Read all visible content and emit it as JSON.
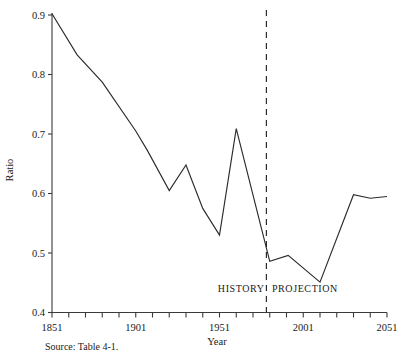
{
  "chart_data": {
    "type": "line",
    "title": "",
    "xlabel": "Year",
    "ylabel": "Ratio",
    "xlim": [
      1851,
      2051
    ],
    "ylim": [
      0.4,
      0.9
    ],
    "xticks": [
      1851,
      1861,
      1871,
      1881,
      1891,
      1901,
      1911,
      1921,
      1931,
      1941,
      1951,
      1961,
      1971,
      1981,
      1991,
      2001,
      2011,
      2021,
      2031,
      2041,
      2051
    ],
    "xtick_labels_shown": [
      "1851",
      "1901",
      "1951",
      "2001",
      "2051"
    ],
    "yticks": [
      0.4,
      0.5,
      0.6,
      0.7,
      0.8,
      0.9
    ],
    "ytick_labels": [
      "0.4",
      "0.5",
      "0.6",
      "0.7",
      "0.8",
      "0.9"
    ],
    "grid": false,
    "legend": "none",
    "x": [
      1851,
      1866,
      1881,
      1901,
      1908,
      1921,
      1931,
      1941,
      1951,
      1961,
      1981,
      1991,
      2001,
      2011,
      2021,
      2031,
      2041,
      2051
    ],
    "values": [
      0.902,
      0.833,
      0.787,
      0.705,
      0.672,
      0.605,
      0.648,
      0.575,
      0.53,
      0.709,
      0.486,
      0.486,
      0.496,
      0.451,
      0.516,
      0.598,
      0.592,
      0.595
    ],
    "series": [
      {
        "name": "Ratio",
        "points": [
          {
            "x": 1851,
            "y": 0.902
          },
          {
            "x": 1866,
            "y": 0.833
          },
          {
            "x": 1881,
            "y": 0.787
          },
          {
            "x": 1901,
            "y": 0.705
          },
          {
            "x": 1908,
            "y": 0.672
          },
          {
            "x": 1921,
            "y": 0.605
          },
          {
            "x": 1931,
            "y": 0.648
          },
          {
            "x": 1941,
            "y": 0.575
          },
          {
            "x": 1951,
            "y": 0.53
          },
          {
            "x": 1961,
            "y": 0.709
          },
          {
            "x": 1981,
            "y": 0.486
          },
          {
            "x": 1992,
            "y": 0.496
          },
          {
            "x": 2011,
            "y": 0.451
          },
          {
            "x": 2031,
            "y": 0.598
          },
          {
            "x": 2041,
            "y": 0.592
          },
          {
            "x": 2051,
            "y": 0.595
          }
        ]
      }
    ],
    "annotations": [
      {
        "name": "history-label",
        "text": "HISTORY",
        "x": 1964,
        "y": 0.438
      },
      {
        "name": "projection-label",
        "text": "PROJECTION",
        "x": 2002,
        "y": 0.438
      },
      {
        "name": "projection-divider",
        "text": "",
        "x": 1979,
        "type": "vertical-dashed-line"
      }
    ],
    "divider_year": 1979,
    "source_note": "Source:  Table 4-1."
  },
  "colors": {
    "line": "#2b2b2b",
    "axis": "#3a3a3a",
    "background": "#ffffff",
    "text": "#1a1a1a"
  }
}
